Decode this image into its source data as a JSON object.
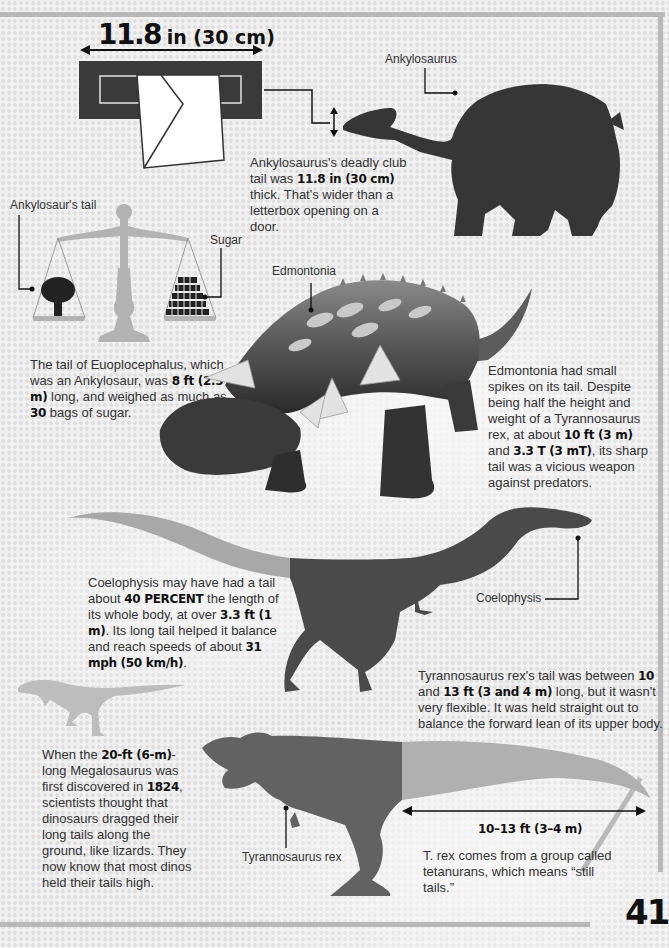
{
  "page": {
    "number": "41",
    "colors": {
      "silhouette_dark": "#3c3c3c",
      "silhouette_mid": "#6b6b6b",
      "tail_highlight": "#a9a9a9",
      "scale_gray": "#b0b0b0",
      "frame": "#b8b8b8",
      "text": "#333333"
    }
  },
  "letterbox": {
    "measurement_value": "11.8",
    "measurement_unit": "in (30 cm)"
  },
  "ankylosaurus": {
    "label": "Ankylosaurus",
    "caption_parts": [
      "Ankylosaurus's deadly club tail was ",
      "11.8 in (30 cm)",
      " thick. That's wider than a letterbox opening on a door."
    ]
  },
  "scale": {
    "left_label": "Ankylosaur's tail",
    "right_label": "Sugar",
    "caption_parts": [
      "The tail of Euoplocephalus, which was an Ankylosaur, was ",
      "8 ft (2.5 m)",
      " long, and weighed as much as ",
      "30",
      " bags of sugar."
    ]
  },
  "edmontonia": {
    "label": "Edmontonia",
    "caption_parts": [
      "Edmontonia had small spikes on its tail. Despite being half the height and weight of a Tyrannosaurus rex, at about ",
      "10 ft (3 m)",
      " and ",
      "3.3 T (3 mT)",
      ", its sharp tail was a vicious weapon against predators."
    ]
  },
  "coelophysis": {
    "label": "Coelophysis",
    "caption_parts": [
      "Coelophysis may have had a tail about ",
      "40 PERCENT",
      " the length of its whole body, at over ",
      "3.3 ft (1 m)",
      ". Its long tail helped it balance and reach speeds of about ",
      "31 mph (50 km/h)",
      "."
    ]
  },
  "trex": {
    "label": "Tyrannosaurus rex",
    "tail_caption_parts": [
      "Tyrannosaurus rex's tail was between ",
      "10",
      " and ",
      "13 ft (3 and 4 m)",
      " long, but it wasn't very flexible. It was held straight out to balance the forward lean of its upper body."
    ],
    "measurement": "10–13 ft (3–4 m)",
    "group_caption": "T. rex comes from a group called tetanurans, which means “still tails.”"
  },
  "megalosaurus": {
    "caption_parts": [
      "When the ",
      "20-ft (6-m)",
      "-long Megalosaurus was first discovered in ",
      "1824",
      ", scientists thought that dinosaurs dragged their long tails along the ground, like lizards. They now know that most dinos held their tails high."
    ]
  }
}
